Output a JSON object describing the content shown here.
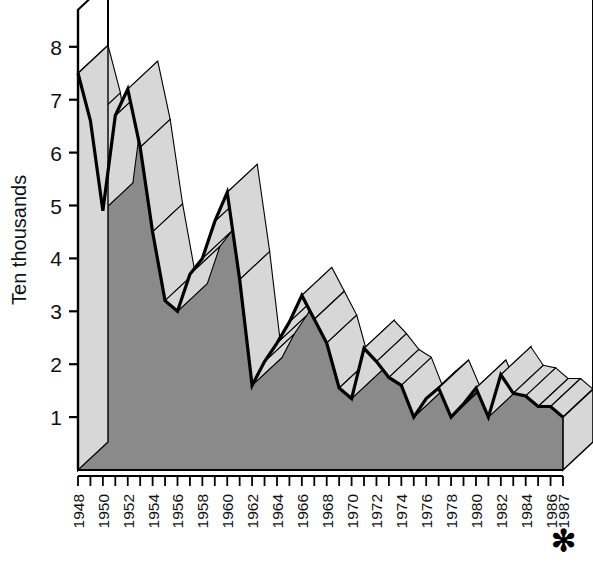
{
  "chart_data": {
    "type": "area",
    "title": "",
    "subtitle": "",
    "xlabel": "",
    "ylabel": "Ten thousands",
    "style": "3d-ribbon-area",
    "grid": true,
    "legend": null,
    "ylim": [
      0,
      8.7
    ],
    "xlim": [
      1948,
      1987
    ],
    "yticks": [
      1,
      2,
      3,
      4,
      5,
      6,
      7,
      8
    ],
    "ytick_labels": [
      "1",
      "2",
      "3",
      "4",
      "5",
      "6",
      "7",
      "8"
    ],
    "x": [
      1948,
      1949,
      1950,
      1951,
      1952,
      1953,
      1954,
      1955,
      1956,
      1957,
      1958,
      1959,
      1960,
      1961,
      1962,
      1963,
      1964,
      1965,
      1966,
      1967,
      1968,
      1969,
      1970,
      1971,
      1972,
      1973,
      1974,
      1975,
      1976,
      1977,
      1978,
      1979,
      1980,
      1981,
      1982,
      1983,
      1984,
      1985,
      1986,
      1987
    ],
    "xtick_labels": [
      "1948",
      "1950",
      "1952",
      "1954",
      "1956",
      "1958",
      "1960",
      "1962",
      "1964",
      "1966",
      "1968",
      "1970",
      "1972",
      "1974",
      "1976",
      "1978",
      "1980",
      "1982",
      "1984",
      "1986",
      "1987"
    ],
    "xtick_label_years": [
      1948,
      1950,
      1952,
      1954,
      1956,
      1958,
      1960,
      1962,
      1964,
      1966,
      1968,
      1970,
      1972,
      1974,
      1976,
      1978,
      1980,
      1982,
      1984,
      1986,
      1987
    ],
    "values": [
      7.5,
      6.6,
      4.9,
      6.7,
      7.2,
      6.1,
      4.5,
      3.2,
      3.0,
      3.7,
      4.0,
      4.7,
      5.25,
      3.6,
      1.6,
      2.05,
      2.4,
      2.8,
      3.3,
      2.85,
      2.4,
      1.55,
      1.35,
      2.3,
      2.05,
      1.75,
      1.6,
      1.0,
      1.35,
      1.55,
      1.0,
      1.25,
      1.55,
      1.0,
      1.8,
      1.45,
      1.4,
      1.2,
      1.2,
      1.0
    ],
    "footnote_marker": "✻",
    "footnote_marker_year": "1987",
    "colors": {
      "front_fill": "#8a8a8a",
      "ribbon_fill": "#d7d7d7",
      "outline": "#000000",
      "gridline": "#333333",
      "background": "#ffffff"
    }
  },
  "axes": {
    "y_title": "Ten thousands",
    "y_tick_labels": [
      "8",
      "7",
      "6",
      "5",
      "4",
      "3",
      "2",
      "1"
    ],
    "x_tick_labels": [
      "1948",
      "1950",
      "1952",
      "1954",
      "1956",
      "1958",
      "1960",
      "1962",
      "1964",
      "1966",
      "1968",
      "1970",
      "1972",
      "1974",
      "1976",
      "1978",
      "1980",
      "1982",
      "1984",
      "1986",
      "1987"
    ]
  },
  "annotations": {
    "asterisk": "✻"
  }
}
